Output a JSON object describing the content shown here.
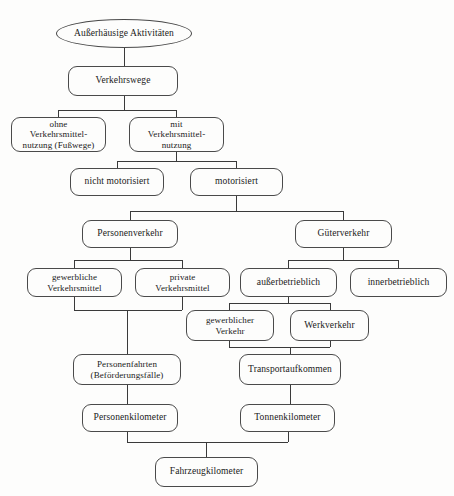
{
  "diagram": {
    "title": "Außerhäusige Aktivitäten",
    "language": "de",
    "nodes": [
      {
        "id": "root",
        "name": "node-ausserhaeusige-aktivitaeten",
        "label": "Außerhäusige Aktivitäten",
        "shape": "ellipse",
        "x": 56,
        "y": 19,
        "w": 136,
        "h": 29
      },
      {
        "id": "verkehrswege",
        "name": "node-verkehrswege",
        "label": "Verkehrswege",
        "shape": "box",
        "x": 68,
        "y": 66,
        "w": 110,
        "h": 30
      },
      {
        "id": "ohne-vm",
        "name": "node-ohne-verkehrsmittelnutzung",
        "label": "ohne\nVerkehrsmittel-\nnutzung (Fußwege)",
        "shape": "box",
        "x": 11,
        "y": 117,
        "w": 95,
        "h": 35
      },
      {
        "id": "mit-vm",
        "name": "node-mit-verkehrsmittelnutzung",
        "label": "mit\nVerkehrsmittel-\nnutzung",
        "shape": "box",
        "x": 129,
        "y": 117,
        "w": 95,
        "h": 35
      },
      {
        "id": "nicht-motorisiert",
        "name": "node-nicht-motorisiert",
        "label": "nicht motorisiert",
        "shape": "box",
        "x": 70,
        "y": 168,
        "w": 94,
        "h": 28
      },
      {
        "id": "motorisiert",
        "name": "node-motorisiert",
        "label": "motorisiert",
        "shape": "box",
        "x": 190,
        "y": 168,
        "w": 93,
        "h": 28
      },
      {
        "id": "personenverkehr",
        "name": "node-personenverkehr",
        "label": "Personenverkehr",
        "shape": "box",
        "x": 82,
        "y": 220,
        "w": 96,
        "h": 28
      },
      {
        "id": "gueterverkehr",
        "name": "node-gueterverkehr",
        "label": "Güterverkehr",
        "shape": "box",
        "x": 295,
        "y": 220,
        "w": 97,
        "h": 28
      },
      {
        "id": "gewerbliche-vm",
        "name": "node-gewerbliche-verkehrsmittel",
        "label": "gewerbliche\nVerkehrsmittel",
        "shape": "box",
        "x": 27,
        "y": 268,
        "w": 95,
        "h": 29
      },
      {
        "id": "private-vm",
        "name": "node-private-verkehrsmittel",
        "label": "private\nVerkehrsmittel",
        "shape": "box",
        "x": 135,
        "y": 268,
        "w": 95,
        "h": 29
      },
      {
        "id": "ausserbetrieblich",
        "name": "node-ausserbetrieblich",
        "label": "außerbetrieblich",
        "shape": "box",
        "x": 240,
        "y": 268,
        "w": 97,
        "h": 29
      },
      {
        "id": "innerbetrieblich",
        "name": "node-innerbetrieblich",
        "label": "innerbetrieblich",
        "shape": "box",
        "x": 350,
        "y": 268,
        "w": 97,
        "h": 29
      },
      {
        "id": "gewerblicher-verkehr",
        "name": "node-gewerblicher-verkehr",
        "label": "gewerblicher\nVerkehr",
        "shape": "box",
        "x": 186,
        "y": 310,
        "w": 88,
        "h": 31
      },
      {
        "id": "werkverkehr",
        "name": "node-werkverkehr",
        "label": "Werkverkehr",
        "shape": "box",
        "x": 290,
        "y": 310,
        "w": 79,
        "h": 31
      },
      {
        "id": "personenfahrten",
        "name": "node-personenfahrten",
        "label": "Personenfahrten\n(Beförderungsfälle)",
        "shape": "box",
        "x": 73,
        "y": 354,
        "w": 108,
        "h": 31
      },
      {
        "id": "transportaufkommen",
        "name": "node-transportaufkommen",
        "label": "Transportaufkommen",
        "shape": "box",
        "x": 239,
        "y": 354,
        "w": 102,
        "h": 31
      },
      {
        "id": "personenkilometer",
        "name": "node-personenkilometer",
        "label": "Personenkilometer",
        "shape": "box",
        "x": 82,
        "y": 404,
        "w": 96,
        "h": 28
      },
      {
        "id": "tonnenkilometer",
        "name": "node-tonnenkilometer",
        "label": "Tonnenkilometer",
        "shape": "box",
        "x": 240,
        "y": 404,
        "w": 95,
        "h": 28
      },
      {
        "id": "fahrzeugkilometer",
        "name": "node-fahrzeugkilometer",
        "label": "Fahrzeugkilometer",
        "shape": "box",
        "x": 155,
        "y": 457,
        "w": 103,
        "h": 30
      }
    ],
    "edges": [
      {
        "name": "edge-root-to-verkehrswege",
        "points": "124,48 124,66"
      },
      {
        "name": "edge-verkehrswege-split",
        "points": "124,96 124,110"
      },
      {
        "name": "edge-verkehrswege-bus",
        "points": "58,110 176,110"
      },
      {
        "name": "edge-to-ohne-verkehrsmittelnutzung",
        "points": "58,110 58,117"
      },
      {
        "name": "edge-to-mit-verkehrsmittelnutzung",
        "points": "176,110 176,117"
      },
      {
        "name": "edge-mit-vm-down",
        "points": "176,152 176,161"
      },
      {
        "name": "edge-mit-vm-bus",
        "points": "117,161 236,161"
      },
      {
        "name": "edge-to-nicht-motorisiert",
        "points": "117,161 117,168"
      },
      {
        "name": "edge-to-motorisiert",
        "points": "236,161 236,168"
      },
      {
        "name": "edge-motorisiert-down",
        "points": "236,196 236,211"
      },
      {
        "name": "edge-motorisiert-bus",
        "points": "130,211 343,211"
      },
      {
        "name": "edge-to-personenverkehr",
        "points": "130,211 130,220"
      },
      {
        "name": "edge-to-gueterverkehr",
        "points": "343,211 343,220"
      },
      {
        "name": "edge-personenverkehr-down",
        "points": "130,248 130,260"
      },
      {
        "name": "edge-personenverkehr-bus",
        "points": "74,260 182,260"
      },
      {
        "name": "edge-to-gewerbliche-verkehrsmittel",
        "points": "74,260 74,268"
      },
      {
        "name": "edge-to-private-verkehrsmittel",
        "points": "182,260 182,268"
      },
      {
        "name": "edge-gueterverkehr-down",
        "points": "343,248 343,260"
      },
      {
        "name": "edge-gueterverkehr-bus",
        "points": "288,260 398,260"
      },
      {
        "name": "edge-to-ausserbetrieblich",
        "points": "288,260 288,268"
      },
      {
        "name": "edge-to-innerbetrieblich",
        "points": "398,260 398,268"
      },
      {
        "name": "edge-gewerbliche-vm-down",
        "points": "74,297 74,310"
      },
      {
        "name": "edge-private-vm-down",
        "points": "182,297 182,310"
      },
      {
        "name": "edge-personenverkehr-merge-bus",
        "points": "74,310 182,310"
      },
      {
        "name": "edge-merge-to-personenfahrten",
        "points": "127,310 127,354"
      },
      {
        "name": "edge-ausserbetrieblich-down",
        "points": "288,297 288,303"
      },
      {
        "name": "edge-ausserbetrieblich-bus",
        "points": "229,303 330,303"
      },
      {
        "name": "edge-to-gewerblicher-verkehr",
        "points": "229,303 229,310"
      },
      {
        "name": "edge-to-werkverkehr",
        "points": "330,303 330,310"
      },
      {
        "name": "edge-gewerblicher-verkehr-down",
        "points": "229,341 229,347"
      },
      {
        "name": "edge-werkverkehr-down",
        "points": "330,341 330,347"
      },
      {
        "name": "edge-gueter-merge-bus",
        "points": "229,347 330,347"
      },
      {
        "name": "edge-merge-to-transportaufkommen",
        "points": "290,347 290,354"
      },
      {
        "name": "edge-personenfahrten-to-personenkm",
        "points": "127,385 127,404"
      },
      {
        "name": "edge-transportaufkommen-to-tonnenkm",
        "points": "290,385 290,404"
      },
      {
        "name": "edge-personenkilometer-down",
        "points": "127,432 127,442"
      },
      {
        "name": "edge-tonnenkilometer-down",
        "points": "288,432 288,442"
      },
      {
        "name": "edge-bottom-merge-bus",
        "points": "127,442 288,442"
      },
      {
        "name": "edge-merge-to-fahrzeugkilometer",
        "points": "206,442 206,457"
      }
    ]
  }
}
